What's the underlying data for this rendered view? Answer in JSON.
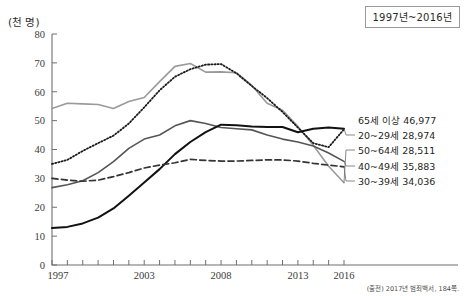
{
  "chart_data": {
    "type": "line",
    "title": "",
    "unit_label": "(천 명)",
    "xlabel": "",
    "ylabel": "",
    "ylim": [
      0,
      80
    ],
    "ytick_values": [
      0,
      10,
      20,
      30,
      40,
      50,
      60,
      70,
      80
    ],
    "xlim": [
      1997,
      2016
    ],
    "x": [
      1997,
      1998,
      1999,
      2000,
      2001,
      2002,
      2003,
      2004,
      2005,
      2006,
      2007,
      2008,
      2009,
      2010,
      2011,
      2012,
      2013,
      2014,
      2015,
      2016
    ],
    "xtick_labels": [
      "1997",
      "2003",
      "2008",
      "2013",
      "2016"
    ],
    "xtick_label_years": [
      1997,
      2003,
      2008,
      2013,
      2016
    ],
    "grid": false,
    "legend_position": "right-inline",
    "series": [
      {
        "name": "50~64세",
        "label": "50~64세 28,511",
        "end_value_text": "28,511",
        "style": "solid",
        "color": "#9a9a9a",
        "width": 1.6,
        "values": [
          54.2,
          56.0,
          55.8,
          55.6,
          54.2,
          56.6,
          58.0,
          63.5,
          68.8,
          69.8,
          66.8,
          66.9,
          66.6,
          62.2,
          56.0,
          53.6,
          48.0,
          41.5,
          34.2,
          28.5
        ]
      },
      {
        "name": "65세 이상",
        "label": "65세 이상 46,977",
        "end_value_text": "46,977",
        "style": "dotted",
        "color": "#1a1a1a",
        "width": 1.8,
        "values": [
          35.0,
          36.4,
          39.5,
          42.2,
          44.8,
          49.0,
          54.6,
          60.5,
          65.2,
          67.8,
          69.4,
          69.6,
          66.4,
          62.0,
          57.8,
          53.0,
          47.6,
          42.2,
          40.8,
          47.0
        ]
      },
      {
        "name": "40~49세",
        "label": "40~49세 35,883",
        "end_value_text": "35,883",
        "style": "solid",
        "color": "#555555",
        "width": 1.6,
        "values": [
          26.8,
          27.8,
          29.2,
          32.0,
          35.8,
          40.4,
          43.6,
          45.0,
          48.2,
          50.0,
          49.0,
          47.6,
          47.2,
          46.8,
          45.0,
          43.6,
          42.6,
          41.2,
          38.8,
          35.9
        ]
      },
      {
        "name": "20~29세",
        "label": "20~29세 28,974",
        "end_value_text": "28,974",
        "style": "solid",
        "color": "#111111",
        "width": 2.0,
        "values": [
          12.8,
          13.2,
          14.4,
          16.4,
          19.6,
          24.0,
          28.6,
          33.2,
          38.4,
          42.6,
          46.0,
          48.6,
          48.4,
          48.0,
          47.8,
          47.8,
          46.0,
          47.2,
          47.6,
          47.2
        ]
      },
      {
        "name": "30~39세",
        "label": "30~39세 34,036",
        "end_value_text": "34,036",
        "style": "dashed",
        "color": "#333333",
        "width": 1.7,
        "values": [
          30.0,
          29.4,
          29.0,
          29.4,
          30.6,
          32.0,
          33.6,
          34.6,
          35.4,
          36.6,
          36.2,
          36.0,
          36.0,
          36.2,
          36.4,
          36.4,
          36.0,
          35.2,
          34.6,
          34.0
        ]
      }
    ]
  },
  "period_badge": "1997년~2016년",
  "source": "(출전) 2017년 범죄백서, 184쪽.",
  "legend": {
    "items": [
      {
        "label": "65세 이상 46,977"
      },
      {
        "label": "20~29세 28,974"
      },
      {
        "label": "50~64세 28,511"
      },
      {
        "label": "40~49세 35,883"
      },
      {
        "label": "30~39세 34,036"
      }
    ]
  }
}
